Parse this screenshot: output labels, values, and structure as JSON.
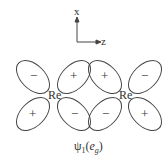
{
  "axes": {
    "vertical": "x",
    "horizontal": "z"
  },
  "atoms": [
    {
      "label": "Re"
    },
    {
      "label": "Re"
    }
  ],
  "lobes": [
    {
      "sign": "−"
    },
    {
      "sign": "+"
    },
    {
      "sign": "+"
    },
    {
      "sign": "−"
    },
    {
      "sign": "+"
    },
    {
      "sign": "−"
    },
    {
      "sign": "−"
    },
    {
      "sign": "+"
    }
  ],
  "caption": {
    "psi": "ψ",
    "sub": "1",
    "open": "(",
    "e": "e",
    "g": "g",
    "close": ")"
  },
  "colors": {
    "stroke": "#444444",
    "text": "#333333"
  }
}
